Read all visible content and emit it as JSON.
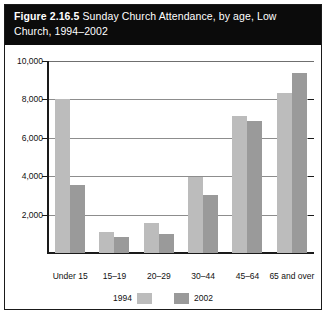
{
  "figure": {
    "number": "Figure 2.16.5",
    "title_rest": " Sunday Church Attendance, by age, Low Church, 1994–2002"
  },
  "chart_data": {
    "type": "bar",
    "title": "Figure 2.16.5 Sunday Church Attendance, by age, Low Church, 1994–2002",
    "xlabel": "",
    "ylabel": "",
    "categories": [
      "Under 15",
      "15–19",
      "20–29",
      "30–44",
      "45–64",
      "65 and over"
    ],
    "series": [
      {
        "name": "1994",
        "color": "#bcbcbc",
        "values": [
          8000,
          1100,
          1550,
          3950,
          7150,
          8350
        ]
      },
      {
        "name": "2002",
        "color": "#9a9a9a",
        "values": [
          3520,
          850,
          1000,
          3000,
          6850,
          9350
        ]
      }
    ],
    "ylim": [
      0,
      10000
    ],
    "yticks": [
      0,
      2000,
      4000,
      6000,
      8000,
      10000
    ],
    "ytick_labels": [
      "",
      "2,000",
      "4,000",
      "6,000",
      "8,000",
      "10,000"
    ],
    "grid": true,
    "legend_position": "bottom"
  },
  "legend": {
    "entries": [
      {
        "label": "1994",
        "color": "#bcbcbc"
      },
      {
        "label": "2002",
        "color": "#9a9a9a"
      }
    ]
  },
  "colors": {
    "title_bg": "#0b0b0b",
    "title_fg": "#ffffff",
    "frame": "#1a1a1a",
    "gridline": "#8d8d8d"
  }
}
